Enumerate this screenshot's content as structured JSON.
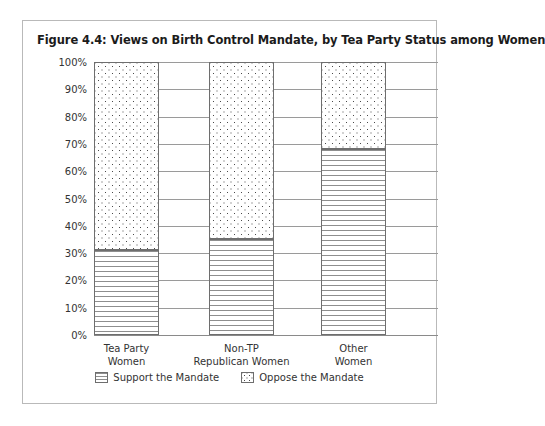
{
  "figure": {
    "title": "Figure 4.4: Views on Birth Control Mandate, by Tea Party Status among Women"
  },
  "legend": {
    "position": "bottom",
    "items": [
      {
        "label": "Support the Mandate",
        "pattern": "horizontal-lines",
        "icon": "support-swatch-icon"
      },
      {
        "label": "Oppose the Mandate",
        "pattern": "dots",
        "icon": "oppose-swatch-icon"
      }
    ]
  },
  "axis": {
    "y_ticks": [
      "0%",
      "10%",
      "20%",
      "30%",
      "40%",
      "50%",
      "60%",
      "70%",
      "80%",
      "90%",
      "100%"
    ],
    "x_categories": [
      {
        "line1": "Tea Party",
        "line2": "Women"
      },
      {
        "line1": "Non-TP",
        "line2": "Republican Women"
      },
      {
        "line1": "Other",
        "line2": "Women"
      }
    ]
  },
  "colors": {
    "frame_border": "#b9b9b9",
    "gridline": "#9a9a9a",
    "bar_border": "#6e6e6e",
    "text": "#333333",
    "title_text": "#1b1b1b",
    "background": "#ffffff"
  },
  "chart_data": {
    "type": "bar",
    "stacked": true,
    "title": "Figure 4.4: Views on Birth Control Mandate, by Tea Party Status among Women",
    "xlabel": "",
    "ylabel": "",
    "ylim": [
      0,
      100
    ],
    "ytick_step": 10,
    "grid": true,
    "legend_position": "bottom",
    "categories": [
      "Tea Party Women",
      "Non-TP Republican Women",
      "Other Women"
    ],
    "series": [
      {
        "name": "Support the Mandate",
        "values": [
          31,
          35,
          68
        ]
      },
      {
        "name": "Oppose the Mandate",
        "values": [
          69,
          65,
          32
        ]
      }
    ]
  }
}
